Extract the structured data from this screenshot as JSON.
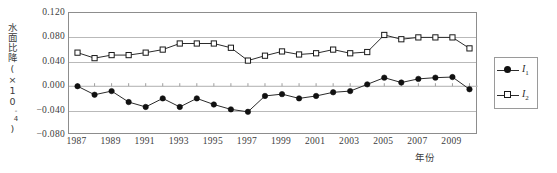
{
  "axes": {
    "y_title_text": "水面比降",
    "y_title_unit_open": "(×10",
    "y_title_unit_exp": "-4",
    "y_title_unit_close": ")",
    "y_ticks": [
      "0.120",
      "0.080",
      "0.040",
      "0.000",
      "−0.040",
      "−0.080"
    ],
    "x_ticks": [
      "1987",
      "1989",
      "1991",
      "1993",
      "1995",
      "1997",
      "1999",
      "2001",
      "2003",
      "2005",
      "2007",
      "2009"
    ],
    "x_title": "年份"
  },
  "legend": {
    "entries": [
      {
        "label_base": "I",
        "label_sub": "1",
        "marker": "filled-circle-icon"
      },
      {
        "label_base": "I",
        "label_sub": "2",
        "marker": "open-square-icon"
      }
    ]
  },
  "colors": {
    "line": "#2b2b2b",
    "grid": "#b9b9b9",
    "frame": "#8d8d8d",
    "text": "#3c3c3c",
    "marker_fill_i1": "#111111",
    "marker_fill_i2": "#ffffff"
  },
  "chart_data": {
    "type": "line",
    "title": "",
    "subtitle": "",
    "xlabel": "年份",
    "ylabel": "水面比降(×10⁻⁴)",
    "xlim": [
      1986.5,
      2010.5
    ],
    "ylim": [
      -0.08,
      0.12
    ],
    "y_tick_values": [
      0.12,
      0.08,
      0.04,
      0.0,
      -0.04,
      -0.08
    ],
    "x_tick_values": [
      1987,
      1989,
      1991,
      1993,
      1995,
      1997,
      1999,
      2001,
      2003,
      2005,
      2007,
      2009
    ],
    "grid": "horizontal",
    "legend_position": "right-outside",
    "x": [
      1987,
      1988,
      1989,
      1990,
      1991,
      1992,
      1993,
      1994,
      1995,
      1996,
      1997,
      1998,
      1999,
      2000,
      2001,
      2002,
      2003,
      2004,
      2005,
      2006,
      2007,
      2008,
      2009,
      2010
    ],
    "series": [
      {
        "name": "I1",
        "marker": "filled-circle",
        "values": [
          0.0,
          -0.014,
          -0.008,
          -0.026,
          -0.034,
          -0.02,
          -0.034,
          -0.02,
          -0.03,
          -0.038,
          -0.042,
          -0.016,
          -0.013,
          -0.02,
          -0.016,
          -0.01,
          -0.008,
          0.003,
          0.014,
          0.006,
          0.012,
          0.014,
          0.015,
          -0.005
        ]
      },
      {
        "name": "I2",
        "marker": "open-square",
        "values": [
          0.055,
          0.046,
          0.051,
          0.051,
          0.055,
          0.06,
          0.07,
          0.07,
          0.07,
          0.063,
          0.042,
          0.05,
          0.057,
          0.052,
          0.054,
          0.06,
          0.054,
          0.056,
          0.084,
          0.077,
          0.08,
          0.08,
          0.08,
          0.062
        ]
      }
    ]
  }
}
